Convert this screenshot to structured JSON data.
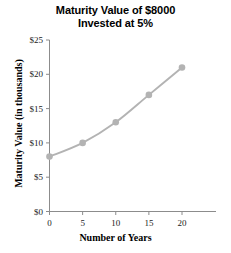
{
  "chart_data": {
    "type": "line",
    "title": "Maturity Value of $8000 Invested at 5%",
    "title_line1": "Maturity Value of $8000",
    "title_line2": "Invested at 5%",
    "xlabel": "Number of Years",
    "ylabel": "Maturity Value (in thousands)",
    "x": [
      0,
      5,
      10,
      15,
      20
    ],
    "values": [
      8,
      10,
      13,
      17,
      21
    ],
    "points": [
      {
        "x": 0,
        "y": 8
      },
      {
        "x": 5,
        "y": 10
      },
      {
        "x": 10,
        "y": 13
      },
      {
        "x": 15,
        "y": 17
      },
      {
        "x": 20,
        "y": 21
      }
    ],
    "xlim": [
      0,
      24
    ],
    "ylim": [
      0,
      25
    ],
    "x_ticks": [
      0,
      5,
      10,
      15,
      20
    ],
    "y_ticks": [
      0,
      5,
      10,
      15,
      20,
      25
    ],
    "x_tick_labels": [
      "0",
      "5",
      "10",
      "15",
      "20"
    ],
    "y_tick_labels": [
      "$0",
      "$5",
      "$10",
      "$15",
      "$20",
      "$25"
    ],
    "grid": false,
    "legend": null,
    "series_color": "#b3b3b3",
    "axis_color": "#8c8c8c",
    "marker": "circle",
    "smooth": true
  }
}
